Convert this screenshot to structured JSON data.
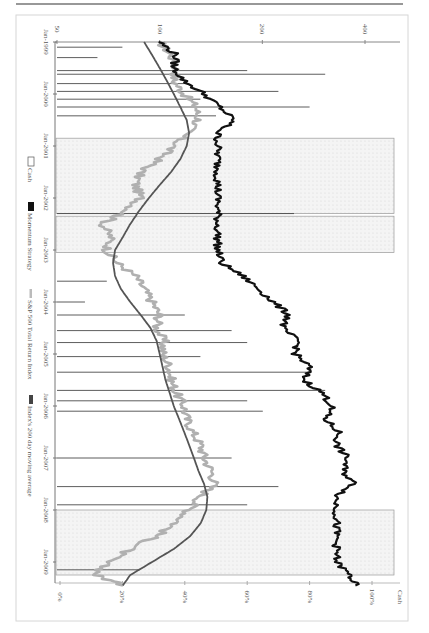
{
  "page": {
    "header_rule": true
  },
  "chart_data": {
    "type": "line",
    "orientation": "rotated-90-clockwise",
    "title": "",
    "xlabel": "",
    "ylabel": "",
    "x_ticks": [
      "Jan-1999",
      "Jan-2000",
      "Jan-2001",
      "Jan-2002",
      "Jan-2003",
      "Jan-2004",
      "Jan-2005",
      "Jan-2006",
      "Jan-2007",
      "Jan-2008",
      "Jan-2009"
    ],
    "primary_axis": {
      "scale": "log",
      "ticks": [
        "50",
        "100",
        "200",
        "400"
      ],
      "tick_values": [
        50,
        100,
        200,
        400
      ],
      "ylim": [
        50,
        400
      ]
    },
    "secondary_axis": {
      "ticks": [
        "0%",
        "20%",
        "40%",
        "60%",
        "80%",
        "100%",
        "Cash"
      ],
      "tick_values": [
        0,
        20,
        40,
        60,
        80,
        100,
        110
      ],
      "ylim": [
        0,
        110
      ]
    },
    "legend": [
      {
        "label": "Cash",
        "style": "box",
        "color": "#ffffff"
      },
      {
        "label": "Momentum Strategy",
        "style": "thick",
        "color": "#111111"
      },
      {
        "label": "S&P 500 Total Return Index",
        "style": "thin-light",
        "color": "#b5b5b5"
      },
      {
        "label": "Index's 200 day moving average",
        "style": "thick-dark-gray",
        "color": "#555555"
      }
    ],
    "x": [
      1999.0,
      1999.25,
      1999.5,
      1999.75,
      2000.0,
      2000.25,
      2000.5,
      2000.75,
      2001.0,
      2001.25,
      2001.5,
      2001.75,
      2002.0,
      2002.25,
      2002.5,
      2002.75,
      2003.0,
      2003.25,
      2003.5,
      2003.75,
      2004.0,
      2004.25,
      2004.5,
      2004.75,
      2005.0,
      2005.25,
      2005.5,
      2005.75,
      2006.0,
      2006.25,
      2006.5,
      2006.75,
      2007.0,
      2007.25,
      2007.5,
      2007.75,
      2008.0,
      2008.25,
      2008.5,
      2008.75,
      2009.0,
      2009.25,
      2009.45
    ],
    "series": [
      {
        "name": "Momentum Strategy",
        "values": [
          100,
          112,
          110,
          118,
          135,
          150,
          165,
          148,
          148,
          148,
          148,
          148,
          148,
          148,
          148,
          148,
          148,
          152,
          175,
          195,
          215,
          240,
          228,
          255,
          250,
          275,
          265,
          300,
          320,
          305,
          335,
          330,
          355,
          345,
          372,
          330,
          330,
          330,
          330,
          330,
          330,
          360,
          375
        ]
      },
      {
        "name": "S&P 500 Total Return Index",
        "values": [
          100,
          108,
          112,
          110,
          118,
          128,
          130,
          120,
          110,
          100,
          88,
          85,
          88,
          80,
          68,
          72,
          70,
          75,
          85,
          90,
          95,
          100,
          98,
          103,
          102,
          107,
          108,
          112,
          118,
          120,
          125,
          132,
          135,
          142,
          145,
          132,
          122,
          112,
          98,
          82,
          70,
          65,
          78
        ]
      },
      {
        "name": "Index's 200 day moving average",
        "values": [
          90,
          95,
          100,
          105,
          110,
          115,
          120,
          122,
          120,
          115,
          108,
          100,
          93,
          87,
          82,
          78,
          74,
          73,
          74,
          77,
          82,
          88,
          94,
          98,
          100,
          102,
          104,
          107,
          110,
          114,
          118,
          122,
          126,
          130,
          135,
          138,
          137,
          132,
          123,
          110,
          95,
          82,
          78
        ]
      }
    ],
    "cash_periods": [
      {
        "start": 2000.85,
        "end": 2002.3,
        "level_pct": 100
      },
      {
        "start": 2002.35,
        "end": 2003.05,
        "level_pct": 100
      },
      {
        "start": 2008.0,
        "end": 2009.25,
        "level_pct": 100
      }
    ],
    "grid": false,
    "legend_position": "left (rotated)"
  }
}
